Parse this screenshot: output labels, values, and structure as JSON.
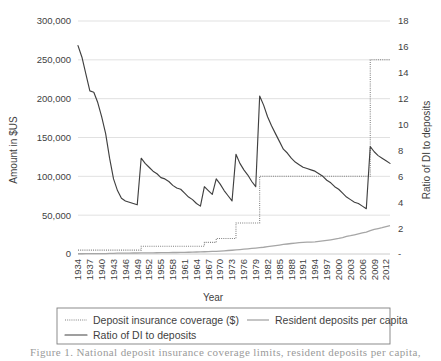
{
  "figure": {
    "caption_partial": "Figure 1.  National deposit insurance coverage limits, resident deposits per capita,"
  },
  "chart_data": {
    "type": "line",
    "title": "",
    "xlabel": "Year",
    "ylabel": "Amount in $US",
    "y2label": "Ratio of DI to deposits",
    "grid": true,
    "legend_position": "bottom",
    "xlim": [
      1934,
      2013
    ],
    "ylim": [
      0,
      300000
    ],
    "y2lim": [
      0,
      18
    ],
    "ytick_labels": [
      "300,000",
      "250,000",
      "200,000",
      "150,000",
      "100,000",
      "50,000",
      "0"
    ],
    "ytick_values": [
      300000,
      250000,
      200000,
      150000,
      100000,
      50000,
      0
    ],
    "y2tick_labels": [
      "18",
      "16",
      "14",
      "12",
      "10",
      "8",
      "6",
      "4",
      "2",
      "-"
    ],
    "y2tick_values": [
      18,
      16,
      14,
      12,
      10,
      8,
      6,
      4,
      2,
      0
    ],
    "xtick_labels": [
      "1934",
      "1937",
      "1940",
      "1943",
      "1946",
      "1949",
      "1952",
      "1955",
      "1958",
      "1961",
      "1964",
      "1967",
      "1970",
      "1973",
      "1976",
      "1979",
      "1982",
      "1985",
      "1988",
      "1991",
      "1994",
      "1997",
      "2000",
      "2003",
      "2006",
      "2009",
      "2012"
    ],
    "x": [
      1934,
      1935,
      1936,
      1937,
      1938,
      1939,
      1940,
      1941,
      1942,
      1943,
      1944,
      1945,
      1946,
      1947,
      1948,
      1949,
      1950,
      1951,
      1952,
      1953,
      1954,
      1955,
      1956,
      1957,
      1958,
      1959,
      1960,
      1961,
      1962,
      1963,
      1964,
      1965,
      1966,
      1967,
      1968,
      1969,
      1970,
      1971,
      1972,
      1973,
      1974,
      1975,
      1976,
      1977,
      1978,
      1979,
      1980,
      1981,
      1982,
      1983,
      1984,
      1985,
      1986,
      1987,
      1988,
      1989,
      1990,
      1991,
      1992,
      1993,
      1994,
      1995,
      1996,
      1997,
      1998,
      1999,
      2000,
      2001,
      2002,
      2003,
      2004,
      2005,
      2006,
      2007,
      2008,
      2009,
      2010,
      2011,
      2012,
      2013
    ],
    "series": [
      {
        "name": "Deposit insurance coverage ($)",
        "axis": "left",
        "style": "dotted",
        "color": "#808080",
        "values": [
          5000,
          5000,
          5000,
          5000,
          5000,
          5000,
          5000,
          5000,
          5000,
          5000,
          5000,
          5000,
          5000,
          5000,
          5000,
          5000,
          10000,
          10000,
          10000,
          10000,
          10000,
          10000,
          10000,
          10000,
          10000,
          10000,
          10000,
          10000,
          10000,
          10000,
          10000,
          10000,
          15000,
          15000,
          15000,
          20000,
          20000,
          20000,
          20000,
          20000,
          40000,
          40000,
          40000,
          40000,
          40000,
          40000,
          100000,
          100000,
          100000,
          100000,
          100000,
          100000,
          100000,
          100000,
          100000,
          100000,
          100000,
          100000,
          100000,
          100000,
          100000,
          100000,
          100000,
          100000,
          100000,
          100000,
          100000,
          100000,
          100000,
          100000,
          100000,
          100000,
          100000,
          100000,
          250000,
          250000,
          250000,
          250000,
          250000,
          250000
        ]
      },
      {
        "name": "Resident deposits per capita",
        "axis": "left",
        "style": "solid-light",
        "color": "#a6a6a6",
        "values": [
          310,
          330,
          360,
          380,
          400,
          430,
          470,
          540,
          680,
          860,
          1010,
          1160,
          1230,
          1250,
          1270,
          1300,
          1340,
          1420,
          1490,
          1560,
          1610,
          1680,
          1730,
          1800,
          1900,
          1950,
          2010,
          2120,
          2260,
          2400,
          2560,
          2720,
          2880,
          3080,
          3290,
          3450,
          3720,
          4080,
          4480,
          4840,
          5220,
          5680,
          6150,
          6600,
          7150,
          7650,
          8200,
          8700,
          9400,
          10100,
          10800,
          11500,
          12300,
          12900,
          13500,
          14100,
          14600,
          15000,
          15200,
          15400,
          15700,
          16200,
          16800,
          17500,
          18300,
          19200,
          20100,
          21200,
          22700,
          23600,
          24700,
          25900,
          27200,
          28300,
          30200,
          31800,
          32800,
          33900,
          35200,
          36600
        ]
      },
      {
        "name": "Ratio of DI to deposits",
        "axis": "right",
        "style": "solid-dark",
        "color": "#404040",
        "values": [
          16.1,
          15.2,
          13.9,
          12.6,
          12.5,
          11.7,
          10.6,
          9.3,
          7.4,
          5.8,
          4.9,
          4.3,
          4.1,
          4.0,
          3.9,
          3.8,
          7.4,
          7.0,
          6.7,
          6.4,
          6.2,
          5.9,
          5.8,
          5.6,
          5.3,
          5.1,
          5.0,
          4.7,
          4.4,
          4.2,
          3.9,
          3.7,
          5.2,
          4.9,
          4.6,
          5.8,
          5.4,
          4.9,
          4.5,
          4.1,
          7.7,
          7.0,
          6.5,
          6.1,
          5.6,
          5.2,
          12.2,
          11.5,
          10.6,
          9.9,
          9.3,
          8.7,
          8.1,
          7.8,
          7.4,
          7.1,
          6.9,
          6.7,
          6.6,
          6.5,
          6.4,
          6.2,
          6.0,
          5.7,
          5.5,
          5.2,
          5.0,
          4.7,
          4.4,
          4.2,
          4.0,
          3.9,
          3.7,
          3.5,
          8.3,
          7.9,
          7.6,
          7.4,
          7.2,
          7.0
        ]
      }
    ],
    "legend": [
      {
        "label": "Deposit insurance coverage ($)",
        "style": "dotted",
        "color": "#808080"
      },
      {
        "label": "Resident deposits per capita",
        "style": "solid-light",
        "color": "#a6a6a6"
      },
      {
        "label": "Ratio of DI to deposits",
        "style": "solid-dark",
        "color": "#404040"
      }
    ]
  }
}
